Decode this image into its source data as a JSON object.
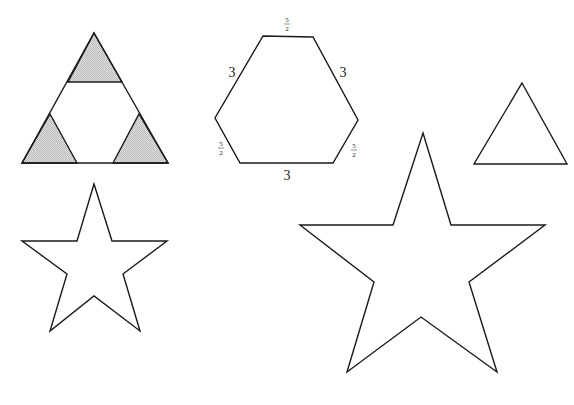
{
  "diagram": {
    "shading_color": "#cfcfcf",
    "stroke_color": "#1a1a1a",
    "shapes": {
      "cut_triangle": {
        "outer": [
          [
            94,
            33
          ],
          [
            168,
            163
          ],
          [
            22,
            163
          ]
        ],
        "corner_triangles": [
          [
            [
              94,
              33
            ],
            [
              122,
              82
            ],
            [
              68,
              82
            ]
          ],
          [
            [
              50,
              114
            ],
            [
              77,
              163
            ],
            [
              22,
              163
            ]
          ],
          [
            [
              139,
              114
            ],
            [
              168,
              163
            ],
            [
              113,
              163
            ]
          ]
        ]
      },
      "hexagon": {
        "vertices": [
          [
            263,
            36
          ],
          [
            313,
            37
          ],
          [
            358,
            120
          ],
          [
            333,
            163
          ],
          [
            240,
            163
          ],
          [
            215,
            118
          ]
        ],
        "labels": {
          "top": "5/2",
          "upper_left": "3",
          "upper_right": "3",
          "lower_left": "5/2",
          "lower_right": "5/2",
          "bottom": "3"
        }
      },
      "small_triangle": {
        "vertices": [
          [
            522,
            83
          ],
          [
            567,
            164
          ],
          [
            474,
            164
          ]
        ]
      },
      "small_star": {
        "vertices": [
          [
            94,
            184
          ],
          [
            112,
            241
          ],
          [
            167,
            241
          ],
          [
            123,
            274
          ],
          [
            140,
            331
          ],
          [
            94,
            296
          ],
          [
            50,
            331
          ],
          [
            67,
            274
          ],
          [
            22,
            241
          ],
          [
            77,
            241
          ]
        ]
      },
      "large_star": {
        "vertices": [
          [
            423,
            133
          ],
          [
            451,
            225
          ],
          [
            545,
            225
          ],
          [
            469,
            282
          ],
          [
            497,
            372
          ],
          [
            421,
            317
          ],
          [
            347,
            372
          ],
          [
            374,
            282
          ],
          [
            300,
            225
          ],
          [
            393,
            225
          ]
        ]
      }
    }
  }
}
